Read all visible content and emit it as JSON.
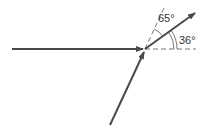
{
  "diagram": {
    "colors": {
      "vector": "#4a4a4a",
      "guide": "#555555",
      "text": "#333333",
      "background": "#ffffff"
    },
    "angles": {
      "between_dashed_and_resultant": "65°",
      "between_horizontal_and_resultant": "36°"
    },
    "elements": [
      {
        "name": "horizontal-vector",
        "type": "arrow"
      },
      {
        "name": "angled-vector",
        "type": "arrow"
      },
      {
        "name": "resultant-vector",
        "type": "arrow"
      },
      {
        "name": "horizontal-reference-line",
        "type": "dashed-line"
      },
      {
        "name": "extension-reference-line",
        "type": "dashed-line"
      }
    ]
  }
}
